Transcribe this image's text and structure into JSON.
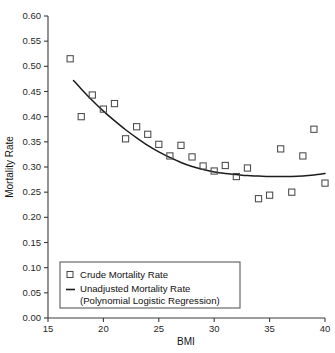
{
  "chart_data": {
    "type": "scatter",
    "title": "",
    "xlabel": "BMI",
    "ylabel": "Mortality Rate",
    "xlim": [
      15,
      40
    ],
    "ylim": [
      0.0,
      0.6
    ],
    "grid": false,
    "legend_position": "lower-left",
    "x_ticks": [
      "15",
      "20",
      "25",
      "30",
      "35",
      "40"
    ],
    "x_tick_values": [
      15,
      20,
      25,
      30,
      35,
      40
    ],
    "y_ticks": [
      "0.00",
      "0.05",
      "0.10",
      "0.15",
      "0.20",
      "0.25",
      "0.30",
      "0.35",
      "0.40",
      "0.45",
      "0.50",
      "0.55",
      "0.60"
    ],
    "y_tick_values": [
      0.0,
      0.05,
      0.1,
      0.15,
      0.2,
      0.25,
      0.3,
      0.35,
      0.4,
      0.45,
      0.5,
      0.55,
      0.6
    ],
    "series": [
      {
        "name": "Crude Mortality Rate",
        "type": "scatter",
        "marker": "open-square",
        "color": "#4a4a4a",
        "x": [
          17,
          18,
          19,
          20,
          21,
          22,
          23,
          24,
          25,
          26,
          27,
          28,
          29,
          30,
          31,
          32,
          33,
          34,
          35,
          36,
          37,
          38,
          39,
          40
        ],
        "y": [
          0.515,
          0.4,
          0.443,
          0.415,
          0.426,
          0.356,
          0.38,
          0.365,
          0.345,
          0.322,
          0.343,
          0.32,
          0.302,
          0.292,
          0.303,
          0.281,
          0.298,
          0.237,
          0.244,
          0.336,
          0.25,
          0.322,
          0.375,
          0.268
        ]
      },
      {
        "name": "Unadjusted Mortality Rate (Polynomial Logistic Regression)",
        "type": "line",
        "color": "#1c1c1c",
        "x": [
          17.3,
          18,
          19,
          20,
          21,
          22,
          23,
          24,
          25,
          26,
          27,
          28,
          29,
          30,
          31,
          32,
          33,
          34,
          35,
          36,
          37,
          38,
          39,
          40
        ],
        "y": [
          0.472,
          0.455,
          0.432,
          0.411,
          0.392,
          0.374,
          0.358,
          0.343,
          0.33,
          0.319,
          0.309,
          0.301,
          0.295,
          0.29,
          0.287,
          0.285,
          0.283,
          0.282,
          0.281,
          0.281,
          0.281,
          0.282,
          0.284,
          0.287
        ]
      }
    ]
  },
  "legend": {
    "items": [
      {
        "swatch": "open-square",
        "label": "Crude Mortality Rate"
      },
      {
        "swatch": "line",
        "label": "Unadjusted Mortality Rate"
      },
      {
        "swatch": "none",
        "label": "(Polynomial Logistic Regression)"
      }
    ]
  },
  "colors": {
    "marker": "#4a4a4a",
    "curve": "#1c1c1c",
    "axis": "#3a3a3a",
    "text": "#111111",
    "background": "#ffffff"
  }
}
